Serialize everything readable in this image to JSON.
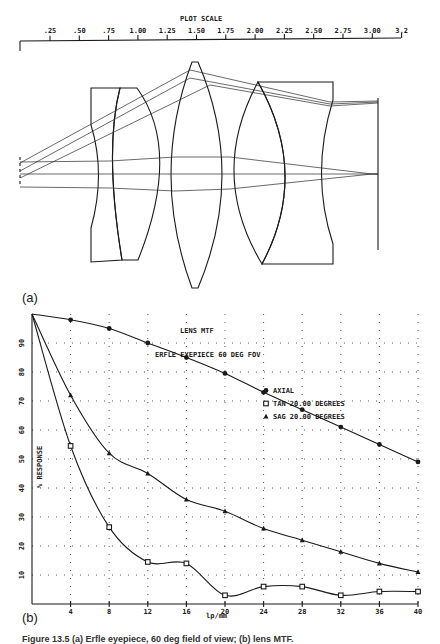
{
  "ruler": {
    "title": "PLOT SCALE",
    "ticks": [
      ".25",
      ".50",
      ".75",
      "1.00",
      "1.25",
      "1.50",
      "1.75",
      "2.00",
      "2.25",
      "2.50",
      "2.75",
      "3.00",
      "3.2"
    ]
  },
  "diagram": {
    "panel_label": "(a)"
  },
  "chart_panel_label": "(b)",
  "caption": "Figure 13.5 (a) Erfle eyepiece, 60 deg field of view; (b) lens MTF.",
  "chart_data": {
    "type": "line",
    "title": "LENS MTF",
    "subtitle": "ERFLE EYEPIECE 60 DEG FOV",
    "xlabel": "lp/mm",
    "ylabel": "% RESPONSE",
    "xlim": [
      0,
      40
    ],
    "ylim": [
      0,
      100
    ],
    "x_ticks": [
      4,
      8,
      12,
      16,
      20,
      24,
      28,
      32,
      36,
      40
    ],
    "y_ticks": [
      10,
      20,
      30,
      40,
      50,
      60,
      70,
      80,
      90
    ],
    "grid": true,
    "legend_position": "upper-right",
    "series": [
      {
        "name": "AXIAL",
        "marker": "circle",
        "x": [
          0,
          4,
          8,
          12,
          16,
          20,
          24,
          28,
          32,
          36,
          40
        ],
        "values": [
          100,
          98,
          95,
          90,
          85,
          79.5,
          73,
          67,
          61,
          55,
          49
        ]
      },
      {
        "name": "TAN 20.00 DEGREES",
        "marker": "square",
        "x": [
          0,
          4,
          8,
          12,
          16,
          20,
          24,
          28,
          32,
          36,
          40
        ],
        "values": [
          100,
          54.5,
          26.5,
          14.5,
          14,
          3,
          6,
          6,
          3,
          4.3,
          4.3
        ]
      },
      {
        "name": "SAG 20.00 DEGREES",
        "marker": "triangle",
        "x": [
          0,
          4,
          8,
          12,
          16,
          20,
          24,
          28,
          32,
          36,
          40
        ],
        "values": [
          100,
          72,
          52,
          45,
          36,
          32,
          26,
          22,
          18,
          14,
          11
        ]
      }
    ]
  }
}
